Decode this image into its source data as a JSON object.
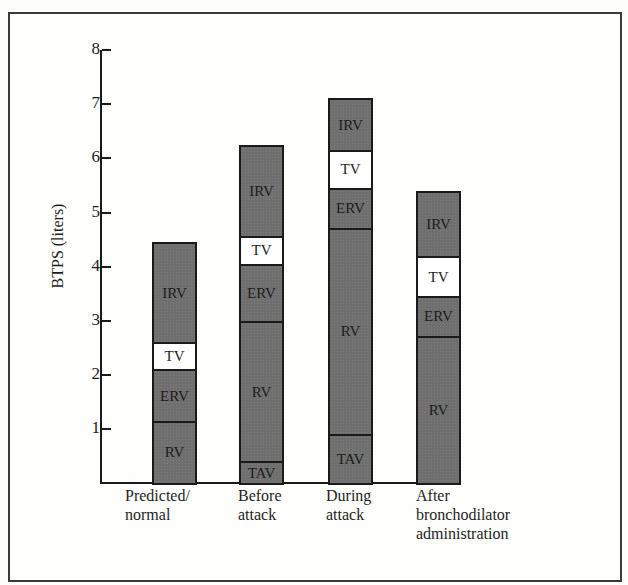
{
  "chart_data": {
    "type": "bar",
    "stacked": true,
    "title": "",
    "xlabel": "",
    "ylabel": "BTPS (liters)",
    "ylim": [
      0,
      8
    ],
    "yticks": [
      1,
      2,
      3,
      4,
      5,
      6,
      7,
      8
    ],
    "grid": false,
    "legend": "none (segments labeled inline)",
    "categories": [
      "Predicted/ normal",
      "Before attack",
      "During attack",
      "After bronchodilator administration"
    ],
    "series": [
      {
        "name": "TAV",
        "values": [
          0,
          0.4,
          0.9,
          0
        ]
      },
      {
        "name": "RV",
        "values": [
          1.15,
          2.6,
          3.82,
          2.72
        ]
      },
      {
        "name": "ERV",
        "values": [
          0.95,
          1.05,
          0.74,
          0.74
        ]
      },
      {
        "name": "TV",
        "values": [
          0.5,
          0.52,
          0.69,
          0.73
        ]
      },
      {
        "name": "IRV",
        "values": [
          1.85,
          1.67,
          0.96,
          1.2
        ]
      }
    ],
    "totals": [
      4.45,
      6.24,
      7.11,
      5.39
    ]
  },
  "labels": {
    "ylabel": "BTPS (liters)",
    "ticks": [
      "1",
      "2",
      "3",
      "4",
      "5",
      "6",
      "7",
      "8"
    ],
    "categories": [
      "Predicted/\nnormal",
      "Before\nattack",
      "During\nattack",
      "After\nbronchodilator\nadministration"
    ]
  },
  "colors": {
    "bar_fill": "#6f6f6f",
    "tv_fill": "#ffffff",
    "outline": "#1a1a1a"
  }
}
